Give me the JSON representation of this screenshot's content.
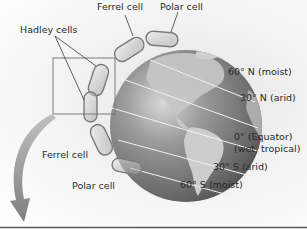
{
  "diagram": {
    "cells": {
      "hadley": "Hadley cells",
      "ferrel_north": "Ferrel cell",
      "polar_north": "Polar cell",
      "ferrel_south": "Ferrel cell",
      "polar_south": "Polar cell"
    },
    "latitudes": [
      {
        "label": "60° N (moist)"
      },
      {
        "label": "30° N (arid)"
      },
      {
        "label": "0° (Equator)",
        "sub": "(wet, tropical)"
      },
      {
        "label": "30° S (arid)"
      },
      {
        "label": "60° S (moist)"
      }
    ],
    "colors": {
      "globe_dark": "#5a5a5a",
      "globe_light": "#a8a8a8",
      "land": "#d0d0d0",
      "text": "#2a2a2a",
      "arrow": "#8a8a8a"
    }
  }
}
